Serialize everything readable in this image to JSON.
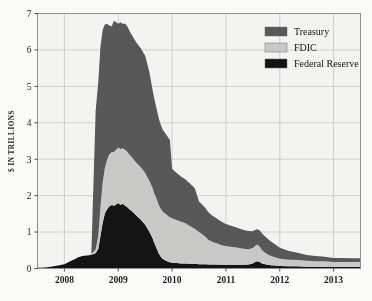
{
  "figure": {
    "background_color": "#fbfbf9",
    "plot_background_color": "#f4f4f2",
    "frame_color": "#8f8f8f",
    "grid_color": "#b9b9b5"
  },
  "axis": {
    "ylabel": "$ IN TRILLIONS",
    "yticks": [
      "0",
      "1",
      "2",
      "3",
      "4",
      "5",
      "6",
      "7"
    ],
    "xticks": [
      "2008",
      "2009",
      "2010",
      "2011",
      "2012",
      "2013"
    ]
  },
  "legend": {
    "position": "top-right",
    "items": [
      {
        "label": "Treasury",
        "color": "#585858"
      },
      {
        "label": "FDIC",
        "color": "#c9c9c7"
      },
      {
        "label": "Federal Reserve",
        "color": "#141414"
      }
    ]
  },
  "chart_data": {
    "type": "area",
    "stacked": true,
    "title": "",
    "subtitle": "",
    "xlabel": "",
    "ylabel": "$ IN TRILLIONS",
    "xlim": [
      2007.5,
      2013.5
    ],
    "ylim": [
      0,
      7
    ],
    "grid": true,
    "legend_position": "top-right",
    "x": [
      2007.5,
      2007.63,
      2007.75,
      2007.88,
      2008.0,
      2008.08,
      2008.17,
      2008.25,
      2008.33,
      2008.42,
      2008.5,
      2008.58,
      2008.63,
      2008.67,
      2008.71,
      2008.75,
      2008.79,
      2008.83,
      2008.88,
      2008.92,
      2008.96,
      2009.0,
      2009.04,
      2009.08,
      2009.13,
      2009.17,
      2009.21,
      2009.25,
      2009.33,
      2009.42,
      2009.5,
      2009.58,
      2009.63,
      2009.67,
      2009.71,
      2009.75,
      2009.79,
      2009.83,
      2009.88,
      2009.92,
      2009.96,
      2010.0,
      2010.08,
      2010.17,
      2010.25,
      2010.33,
      2010.42,
      2010.5,
      2010.58,
      2010.63,
      2010.67,
      2010.75,
      2010.83,
      2010.92,
      2011.0,
      2011.08,
      2011.17,
      2011.25,
      2011.33,
      2011.42,
      2011.5,
      2011.54,
      2011.58,
      2011.63,
      2011.67,
      2011.75,
      2011.83,
      2011.92,
      2012.0,
      2012.17,
      2012.33,
      2012.5,
      2012.67,
      2012.83,
      2013.0,
      2013.17,
      2013.33,
      2013.5
    ],
    "series": [
      {
        "name": "Federal Reserve",
        "color": "#141414",
        "values": [
          0.02,
          0.03,
          0.05,
          0.08,
          0.12,
          0.18,
          0.24,
          0.3,
          0.34,
          0.36,
          0.38,
          0.42,
          0.55,
          0.9,
          1.25,
          1.5,
          1.62,
          1.7,
          1.74,
          1.72,
          1.76,
          1.8,
          1.74,
          1.78,
          1.72,
          1.68,
          1.62,
          1.58,
          1.46,
          1.34,
          1.2,
          1.0,
          0.86,
          0.7,
          0.56,
          0.42,
          0.32,
          0.26,
          0.22,
          0.19,
          0.17,
          0.16,
          0.15,
          0.14,
          0.14,
          0.13,
          0.13,
          0.12,
          0.12,
          0.12,
          0.11,
          0.11,
          0.11,
          0.1,
          0.1,
          0.1,
          0.1,
          0.1,
          0.1,
          0.11,
          0.14,
          0.18,
          0.2,
          0.18,
          0.14,
          0.11,
          0.09,
          0.08,
          0.07,
          0.06,
          0.06,
          0.05,
          0.05,
          0.05,
          0.04,
          0.04,
          0.04,
          0.04
        ]
      },
      {
        "name": "FDIC",
        "color": "#c9c9c7",
        "values": [
          0.0,
          0.0,
          0.0,
          0.0,
          0.0,
          0.0,
          0.0,
          0.0,
          0.0,
          0.0,
          0.02,
          0.1,
          0.35,
          0.8,
          1.1,
          1.25,
          1.35,
          1.42,
          1.46,
          1.48,
          1.5,
          1.52,
          1.54,
          1.52,
          1.54,
          1.52,
          1.5,
          1.48,
          1.46,
          1.44,
          1.42,
          1.4,
          1.38,
          1.36,
          1.36,
          1.34,
          1.32,
          1.3,
          1.28,
          1.26,
          1.24,
          1.22,
          1.18,
          1.14,
          1.1,
          1.04,
          0.96,
          0.88,
          0.8,
          0.74,
          0.68,
          0.62,
          0.58,
          0.54,
          0.52,
          0.5,
          0.48,
          0.46,
          0.44,
          0.42,
          0.42,
          0.44,
          0.46,
          0.42,
          0.36,
          0.3,
          0.26,
          0.22,
          0.2,
          0.18,
          0.17,
          0.16,
          0.15,
          0.15,
          0.14,
          0.14,
          0.14,
          0.14
        ]
      },
      {
        "name": "Treasury",
        "color": "#585858",
        "values": [
          0.0,
          0.0,
          0.0,
          0.0,
          0.0,
          0.0,
          0.0,
          0.0,
          0.0,
          0.0,
          0.0,
          3.8,
          4.25,
          4.4,
          4.2,
          3.95,
          3.75,
          3.55,
          3.45,
          3.6,
          3.5,
          3.4,
          3.48,
          3.42,
          3.46,
          3.44,
          3.4,
          3.36,
          3.3,
          3.26,
          3.22,
          2.98,
          2.72,
          2.6,
          2.48,
          2.38,
          2.3,
          2.24,
          2.2,
          2.16,
          2.12,
          1.36,
          1.3,
          1.24,
          1.2,
          1.16,
          1.12,
          0.84,
          0.8,
          0.78,
          0.76,
          0.72,
          0.68,
          0.64,
          0.6,
          0.58,
          0.56,
          0.54,
          0.52,
          0.5,
          0.46,
          0.44,
          0.42,
          0.44,
          0.46,
          0.44,
          0.4,
          0.36,
          0.3,
          0.24,
          0.2,
          0.16,
          0.14,
          0.12,
          0.11,
          0.11,
          0.1,
          0.1
        ]
      }
    ],
    "stack_order": [
      "Federal Reserve",
      "FDIC",
      "Treasury"
    ],
    "annotations": [
      {
        "text": "Peak total support ~6.7 trillion",
        "x": 2008.67,
        "y": 6.7
      },
      {
        "text": "Federal Reserve peak ~1.8 trillion",
        "x": 2009.0,
        "y": 1.8
      },
      {
        "text": "Mid-2011 bump ~0.65 trillion",
        "x": 2011.58,
        "y": 0.65
      }
    ]
  }
}
